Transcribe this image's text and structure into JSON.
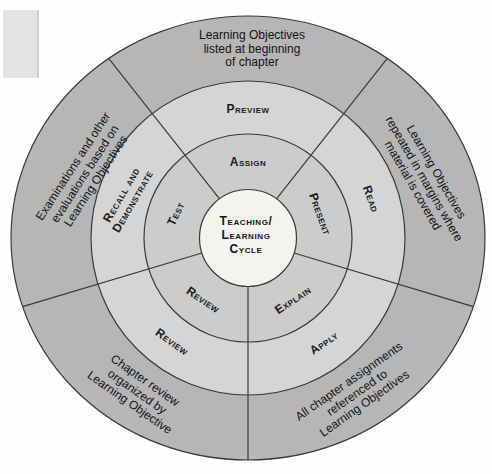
{
  "diagram": {
    "title_semantic": "Teaching/Learning Cycle",
    "hub": {
      "line1": "Teaching/",
      "line2": "Learning",
      "line3": "Cycle"
    },
    "cycle_ring": {
      "top": "Assign",
      "right": "Present",
      "bottom_right": "Explain",
      "bottom_left": "Review",
      "left": "Test"
    },
    "activity_ring": {
      "top": "Preview",
      "right": "Read",
      "bottom_right": "Apply",
      "bottom_left": "Review",
      "left_line1": "Recall and",
      "left_line2": "Demonstrate"
    },
    "feature_ring": {
      "top": {
        "line1": "Learning Objectives",
        "line2": "listed at beginning",
        "line3": "of chapter"
      },
      "right": {
        "line1": "Learning Objectives",
        "line2": "repeated in margins where",
        "line3": "material is covered"
      },
      "bottom_right": {
        "line1": "All chapter assignments",
        "line2": "referenced to",
        "line3": "Learning Objectives"
      },
      "bottom_left": {
        "line1": "Chapter review",
        "line2": "organized by",
        "line3": "Learning Objective"
      },
      "left": {
        "line1": "Examinations and other",
        "line2": "evaluations based on",
        "line3": "Learning Objectives"
      }
    },
    "colors": {
      "outer_ring": "#b6b6b6",
      "middle_ring": "#d5d5d5",
      "inner_ring": "#cccccc",
      "hub": "#f4f3f0",
      "line": "#3a3a3a"
    }
  }
}
